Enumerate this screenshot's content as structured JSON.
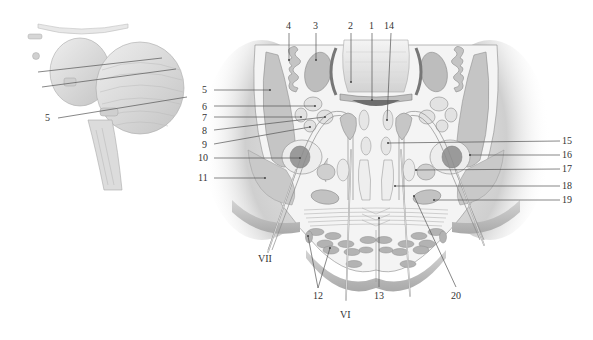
{
  "figure": {
    "type": "anatomical-illustration",
    "colors": {
      "background": "#ffffff",
      "tissue_light": "#f2f2f2",
      "tissue_mid": "#d9d9d9",
      "tissue_shadow": "#bdbdbd",
      "nucleus_gray": "#a8a8a8",
      "nucleus_dark": "#8c8c8c",
      "outline": "#7a7a7a",
      "label_text": "#333333"
    }
  },
  "inset": {
    "label": "5",
    "description": "lateral view of brainstem and cerebellum with section plane lines"
  },
  "labels": {
    "top": [
      {
        "id": "l4",
        "text": "4"
      },
      {
        "id": "l3",
        "text": "3"
      },
      {
        "id": "l2",
        "text": "2"
      },
      {
        "id": "l1",
        "text": "1"
      },
      {
        "id": "l14",
        "text": "14"
      }
    ],
    "left": [
      {
        "id": "l5",
        "text": "5"
      },
      {
        "id": "l6",
        "text": "6"
      },
      {
        "id": "l7",
        "text": "7"
      },
      {
        "id": "l8",
        "text": "8"
      },
      {
        "id": "l9",
        "text": "9"
      },
      {
        "id": "l10",
        "text": "10"
      },
      {
        "id": "l11",
        "text": "11"
      }
    ],
    "right": [
      {
        "id": "l15",
        "text": "15"
      },
      {
        "id": "l16",
        "text": "16"
      },
      {
        "id": "l17",
        "text": "17"
      },
      {
        "id": "l18",
        "text": "18"
      },
      {
        "id": "l19",
        "text": "19"
      }
    ],
    "bottom": [
      {
        "id": "l12",
        "text": "12"
      },
      {
        "id": "l13",
        "text": "13"
      },
      {
        "id": "l20",
        "text": "20"
      }
    ],
    "nerves": [
      {
        "id": "nVII",
        "text": "VII"
      },
      {
        "id": "nVI",
        "text": "VI"
      }
    ]
  }
}
